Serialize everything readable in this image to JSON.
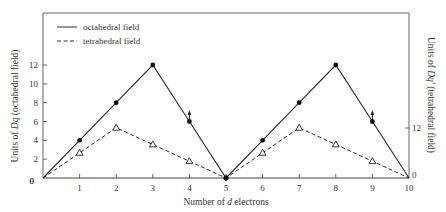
{
  "chart_data": {
    "type": "line",
    "title": "",
    "xlabel": "Number of d electrons",
    "ylabel_left": "Units of Dq (octahedral field)",
    "ylabel_right": "Units of Dq' (tetrahedral field)",
    "x": [
      0,
      1,
      2,
      3,
      4,
      5,
      6,
      7,
      8,
      9,
      10
    ],
    "x_tick_labels": [
      "0",
      "1",
      "2",
      "3",
      "4",
      "5",
      "6",
      "7",
      "8",
      "9",
      "10"
    ],
    "y_tick_labels_left": [
      "0",
      "2",
      "4",
      "6",
      "8",
      "10",
      "12"
    ],
    "y_ticks_left": [
      0,
      2,
      4,
      6,
      8,
      10,
      12
    ],
    "y_tick_labels_right": [
      "0",
      "12"
    ],
    "ylim": [
      0,
      12
    ],
    "xlim": [
      0,
      10
    ],
    "grid": false,
    "legend_position": "upper left",
    "series": [
      {
        "name": "octahedral field",
        "line_style": "solid",
        "marker": "filled-circle",
        "values": [
          0,
          4,
          8,
          12,
          6,
          0,
          4,
          8,
          12,
          6,
          0
        ]
      },
      {
        "name": "tetrahedral field",
        "line_style": "dashed",
        "marker": "open-triangle",
        "values": [
          0,
          2.67,
          5.33,
          3.56,
          1.78,
          0,
          2.67,
          5.33,
          3.56,
          1.78,
          0
        ]
      }
    ],
    "annotations": [
      {
        "x": 4,
        "type": "up-arrow",
        "note": "arrow above d4 octahedral point"
      },
      {
        "x": 9,
        "type": "up-arrow",
        "note": "arrow above d9 octahedral point"
      }
    ]
  },
  "legend": {
    "octahedral": "octahedral field",
    "tetrahedral": "tetrahedral field"
  },
  "axes": {
    "xlabel_prefix": "Number of ",
    "xlabel_italic": "d",
    "xlabel_suffix": " electrons",
    "ylabel_left_prefix": "Units of ",
    "ylabel_left_italic": "Dq",
    "ylabel_left_suffix": " (octahedral field)",
    "ylabel_right_prefix": "Units of ",
    "ylabel_right_italic": "Dq'",
    "ylabel_right_suffix": " (tetrahedral field)",
    "right_tick_0": "0",
    "right_tick_12": "12"
  }
}
